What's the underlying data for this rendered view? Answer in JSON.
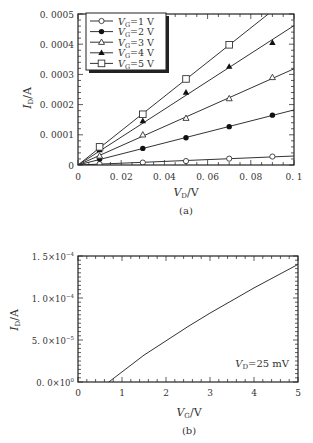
{
  "chart_data": [
    {
      "id": "a",
      "type": "line",
      "caption": "(a)",
      "xlabel": "V_D/V",
      "ylabel": "I_D/A",
      "xlim": [
        0,
        0.1
      ],
      "ylim": [
        0,
        0.0005
      ],
      "x_ticks": [
        "0",
        "0.02",
        "0.04",
        "0.06",
        "0.08",
        "0.1"
      ],
      "y_ticks": [
        "0",
        "0.0001",
        "0.0002",
        "0.0003",
        "0.0004",
        "0.0005"
      ],
      "legend_position": "upper left",
      "x": [
        0.01,
        0.03,
        0.05,
        0.07,
        0.09
      ],
      "series": [
        {
          "name": "VG=1 V",
          "marker": "open-circle",
          "values": [
            3e-06,
            8e-06,
            1.3e-05,
            2.1e-05,
            2.8e-05
          ]
        },
        {
          "name": "VG=2 V",
          "marker": "filled-circle",
          "values": [
            2e-05,
            5.5e-05,
            9e-05,
            0.000127,
            0.000165
          ]
        },
        {
          "name": "VG=3 V",
          "marker": "open-triangle",
          "values": [
            3e-05,
            0.0001,
            0.000155,
            0.00022,
            0.00029
          ]
        },
        {
          "name": "VG=4 V",
          "marker": "filled-triangle",
          "values": [
            5e-05,
            0.000146,
            0.00024,
            0.000326,
            0.000405
          ]
        },
        {
          "name": "VG=5 V",
          "marker": "open-square",
          "values": [
            6e-05,
            0.000168,
            0.000285,
            0.000398,
            0.00051
          ]
        }
      ]
    },
    {
      "id": "b",
      "type": "line",
      "caption": "(b)",
      "xlabel": "V_G/V",
      "ylabel": "I_D/A",
      "xlim": [
        0,
        5
      ],
      "ylim": [
        0,
        0.00015
      ],
      "x_ticks": [
        "0",
        "1",
        "2",
        "3",
        "4",
        "5"
      ],
      "y_ticks": [
        "0.0×10⁰",
        "5.0×10⁻⁵",
        "1.0×10⁻⁴",
        "1.5×10⁻⁴"
      ],
      "annotation": "V_D=25 mV",
      "x": [
        0.7,
        1.0,
        1.5,
        2.0,
        2.5,
        3.0,
        3.5,
        4.0,
        4.5,
        5.0
      ],
      "series": [
        {
          "name": "VD=25 mV",
          "values": [
            0,
            1.2e-05,
            3.2e-05,
            4.9e-05,
            6.6e-05,
            8.2e-05,
            9.7e-05,
            0.000112,
            0.000126,
            0.00014
          ]
        }
      ]
    }
  ],
  "labels": {
    "a": {
      "ylabel_main": "I",
      "ylabel_sub": "D",
      "ylabel_unit": "/A",
      "xlabel_main": "V",
      "xlabel_sub": "D",
      "xlabel_unit": "/V",
      "caption": "(a)",
      "legend": [
        {
          "main": "V",
          "sub": "G",
          "rest": "=1  V"
        },
        {
          "main": "V",
          "sub": "G",
          "rest": "=2  V"
        },
        {
          "main": "V",
          "sub": "G",
          "rest": "=3  V"
        },
        {
          "main": "V",
          "sub": "G",
          "rest": "=4  V"
        },
        {
          "main": "V",
          "sub": "G",
          "rest": "=5  V"
        }
      ]
    },
    "b": {
      "ylabel_main": "I",
      "ylabel_sub": "D",
      "ylabel_unit": "/A",
      "xlabel_main": "V",
      "xlabel_sub": "G",
      "xlabel_unit": "/V",
      "caption": "(b)",
      "annot_main": "V",
      "annot_sub": "D",
      "annot_rest": "=25  mV",
      "y_tick_mant": [
        "0.0×10",
        "5.0×10",
        "1.0×10",
        "1.5×10"
      ],
      "y_tick_exp": [
        "0",
        "−5",
        "−4",
        "−4"
      ]
    }
  }
}
